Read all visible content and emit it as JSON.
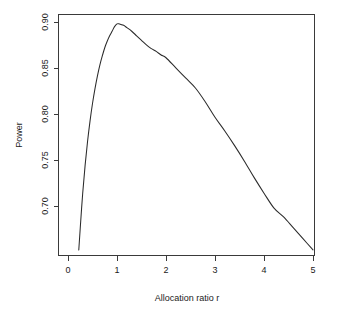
{
  "chart_data": {
    "type": "line",
    "title": "",
    "xlabel": "Allocation ratio r",
    "ylabel": "Power",
    "xlim": [
      0.0,
      5.2
    ],
    "ylim": [
      0.645,
      0.905
    ],
    "xticks": [
      0,
      1,
      2,
      3,
      4,
      5
    ],
    "xticklabels": [
      "0",
      "1",
      "2",
      "3",
      "4",
      "5"
    ],
    "yticks": [
      0.7,
      0.75,
      0.8,
      0.85,
      0.9
    ],
    "yticklabels": [
      "0.70",
      "0.75",
      "0.80",
      "0.85",
      "0.90"
    ],
    "grid": false,
    "legend": null,
    "line_color": "#2b2b2b",
    "series": [
      {
        "name": "Power",
        "x": [
          0.22,
          0.25,
          0.3,
          0.35,
          0.4,
          0.45,
          0.5,
          0.55,
          0.6,
          0.65,
          0.7,
          0.75,
          0.8,
          0.85,
          0.9,
          0.95,
          1.0,
          1.05,
          1.1,
          1.15,
          1.2,
          1.3,
          1.4,
          1.5,
          1.6,
          1.7,
          1.8,
          1.9,
          2.0,
          2.2,
          2.4,
          2.6,
          2.8,
          3.0,
          3.2,
          3.4,
          3.6,
          3.8,
          4.0,
          4.2,
          4.4,
          4.6,
          4.8,
          5.0
        ],
        "y": [
          0.652,
          0.676,
          0.714,
          0.745,
          0.771,
          0.793,
          0.812,
          0.828,
          0.842,
          0.854,
          0.864,
          0.873,
          0.88,
          0.886,
          0.891,
          0.896,
          0.899,
          0.899,
          0.898,
          0.897,
          0.895,
          0.891,
          0.886,
          0.881,
          0.876,
          0.872,
          0.869,
          0.865,
          0.862,
          0.851,
          0.84,
          0.829,
          0.814,
          0.797,
          0.782,
          0.766,
          0.749,
          0.731,
          0.714,
          0.698,
          0.688,
          0.676,
          0.664,
          0.652
        ]
      }
    ],
    "annotations": []
  },
  "axes": {
    "ylabel": "Power",
    "xlabel": "Allocation ratio r",
    "xticklabels": [
      "0",
      "1",
      "2",
      "3",
      "4",
      "5"
    ],
    "yticklabels": [
      "0.70",
      "0.75",
      "0.80",
      "0.85",
      "0.90"
    ]
  }
}
